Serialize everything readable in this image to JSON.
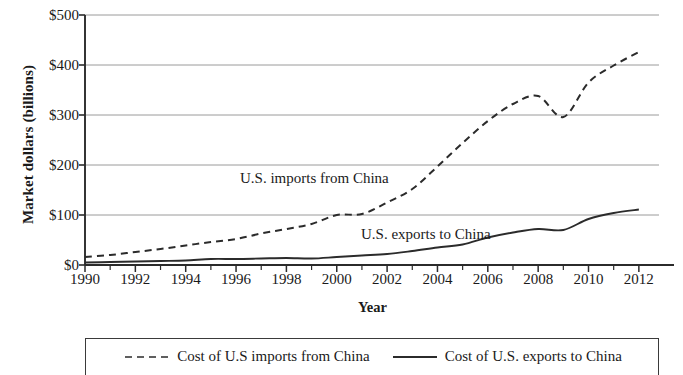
{
  "chart_data": {
    "type": "line",
    "title": "",
    "xlabel": "Year",
    "ylabel": "Market dollars (billions)",
    "xlim": [
      1990,
      2012.8
    ],
    "ylim": [
      0,
      500
    ],
    "grid": true,
    "legend_position": "bottom",
    "y_ticks": [
      "$0",
      "$100",
      "$200",
      "$300",
      "$400",
      "$500"
    ],
    "y_tick_values": [
      0,
      100,
      200,
      300,
      400,
      500
    ],
    "x_ticks": [
      "1990",
      "1992",
      "1994",
      "1996",
      "1998",
      "2000",
      "2002",
      "2004",
      "2006",
      "2008",
      "2010",
      "2012"
    ],
    "x_tick_values": [
      1990,
      1992,
      1994,
      1996,
      1998,
      2000,
      2002,
      2004,
      2006,
      2008,
      2010,
      2012
    ],
    "x_minor_ticks": [
      1991,
      1993,
      1995,
      1997,
      1999,
      2001,
      2003,
      2005,
      2007,
      2009,
      2011
    ],
    "x": [
      1990,
      1991,
      1992,
      1993,
      1994,
      1995,
      1996,
      1997,
      1998,
      1999,
      2000,
      2001,
      2002,
      2003,
      2004,
      2005,
      2006,
      2007,
      2008,
      2009,
      2010,
      2011,
      2012
    ],
    "series": [
      {
        "name": "Cost of U.S imports from China",
        "style": "dashed",
        "color": "#2b2b2b",
        "annotation": "U.S. imports from China",
        "values": [
          16,
          20,
          26,
          32,
          39,
          46,
          52,
          63,
          72,
          82,
          100,
          102,
          125,
          152,
          197,
          244,
          288,
          322,
          338,
          296,
          365,
          399,
          426
        ]
      },
      {
        "name": "Cost of U.S. exports to China",
        "style": "solid",
        "color": "#2b2b2b",
        "annotation": "U.S. exports to China",
        "values": [
          5,
          6,
          7,
          8,
          9,
          12,
          12,
          13,
          14,
          13,
          16,
          19,
          22,
          28,
          35,
          41,
          55,
          65,
          72,
          70,
          92,
          104,
          111
        ]
      }
    ],
    "annotations": [
      {
        "text": "U.S. imports from China",
        "x": 2000,
        "y": 185
      },
      {
        "text": "U.S. exports to China",
        "x": 2005,
        "y": 65
      }
    ]
  },
  "legend": {
    "items": [
      {
        "label": "Cost of U.S imports from China",
        "style": "dashed"
      },
      {
        "label": "Cost of U.S. exports to China",
        "style": "solid"
      }
    ]
  }
}
